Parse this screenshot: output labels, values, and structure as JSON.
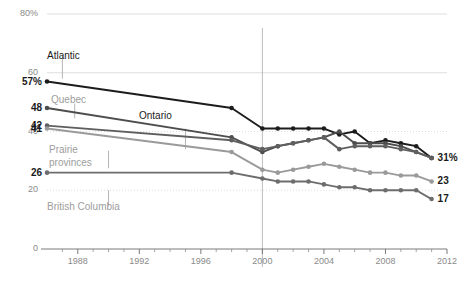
{
  "chart_data": {
    "type": "line",
    "title": "",
    "subtitle": "",
    "xlabel": "",
    "ylabel": "",
    "xlim": [
      1986,
      2012
    ],
    "ylim": [
      0,
      80
    ],
    "grid": true,
    "legend_position": "inline-annotations",
    "x": [
      1986,
      1998,
      2000,
      2001,
      2002,
      2003,
      2004,
      2005,
      2006,
      2007,
      2008,
      2009,
      2010,
      2011
    ],
    "y_ticks": [
      {
        "value": 80,
        "label": "80%"
      },
      {
        "value": 60,
        "label": "60"
      },
      {
        "value": 40,
        "label": "40"
      },
      {
        "value": 20,
        "label": "20"
      },
      {
        "value": 0,
        "label": "0"
      }
    ],
    "x_ticks": [
      {
        "value": 1988,
        "label": "1988"
      },
      {
        "value": 1992,
        "label": "1992"
      },
      {
        "value": 1996,
        "label": "1996"
      },
      {
        "value": 2000,
        "label": "2000"
      },
      {
        "value": 2004,
        "label": "2004"
      },
      {
        "value": 2008,
        "label": "2008"
      },
      {
        "value": 2012,
        "label": "2012"
      }
    ],
    "x_minor_ticks": [
      1987,
      1989,
      1990,
      1991,
      1993,
      1994,
      1995,
      1997,
      1998,
      1999,
      2001,
      2002,
      2003,
      2005,
      2006,
      2007,
      2009,
      2010,
      2011
    ],
    "reference_line": {
      "x": 2000,
      "color": "#b4b4b4"
    },
    "series": [
      {
        "name": "Atlantic",
        "color": "#1c1c1c",
        "start_label": "57%",
        "end_label": "31%",
        "label_x": 1988.6,
        "label_y": 70,
        "values": [
          57,
          48,
          41,
          41,
          41,
          41,
          41,
          39,
          40,
          36,
          37,
          36,
          35,
          31
        ]
      },
      {
        "name": "Quebec",
        "color": "#4d4d4d",
        "start_label": "48",
        "end_label": "",
        "label_x": 1988.1,
        "label_y": 52.5,
        "values": [
          48,
          38,
          33,
          35,
          36,
          37,
          38,
          40,
          36,
          36,
          36,
          35,
          33,
          31
        ]
      },
      {
        "name": "Ontario",
        "color": "#5f5f5f",
        "start_label": "42",
        "end_label": "",
        "label_x": 1994.6,
        "label_y": 45,
        "values": [
          42,
          37,
          34,
          35,
          36,
          37,
          38,
          34,
          35,
          35,
          35,
          34,
          33,
          31
        ]
      },
      {
        "name": "Prairie provinces",
        "color": "#9a9a9a",
        "start_label": "41",
        "end_label": "23",
        "label_x": 1988.1,
        "label_y": 35.5,
        "values": [
          41,
          33,
          27,
          26,
          27,
          28,
          29,
          28,
          27,
          26,
          26,
          25,
          25,
          23
        ]
      },
      {
        "name": "British Columbia",
        "color": "#6d6d6d",
        "start_label": "26",
        "end_label": "17",
        "label_x": 1988.1,
        "label_y": 12,
        "values": [
          26,
          26,
          24,
          23,
          23,
          23,
          22,
          21,
          21,
          20,
          20,
          20,
          20,
          17
        ]
      }
    ]
  },
  "annotations": {
    "atlantic_leader": "Atlantic",
    "quebec_leader": "Quebec",
    "ontario_leader": "Ontario",
    "prairie_leader_line1": "Prairie",
    "prairie_leader_line2": "provinces",
    "bc_leader": "British Columbia"
  }
}
